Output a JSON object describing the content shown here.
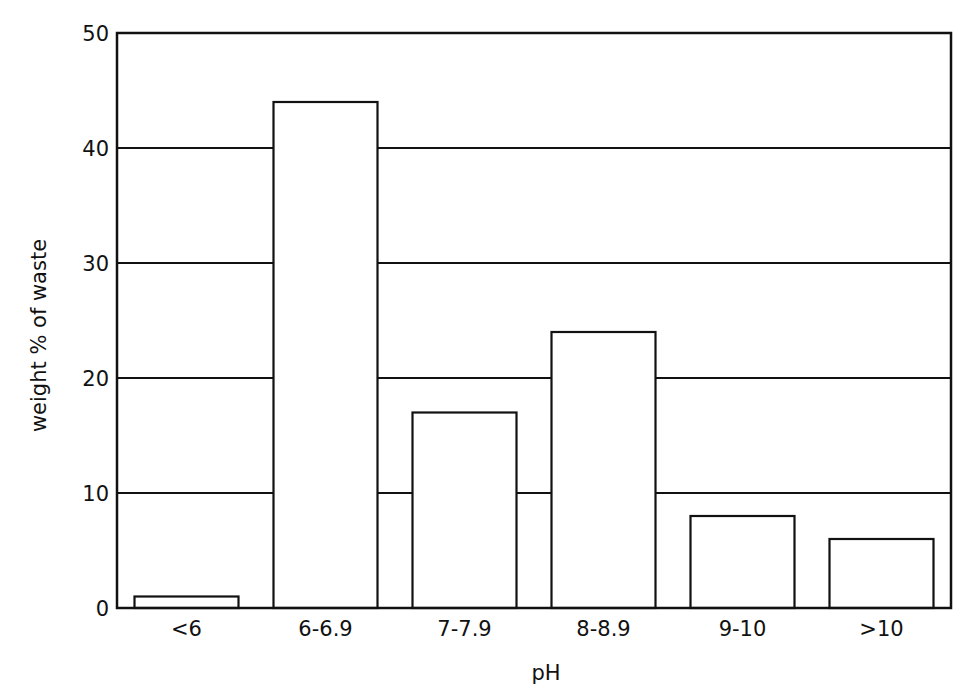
{
  "chart_data": {
    "type": "bar",
    "title": "",
    "xlabel": "pH",
    "ylabel": "weight % of waste",
    "categories": [
      "<6",
      "6-6.9",
      "7-7.9",
      "8-8.9",
      "9-10",
      ">10"
    ],
    "values": [
      1,
      44,
      17,
      24,
      8,
      6
    ],
    "ylim": [
      0,
      50
    ],
    "yticks": [
      0,
      10,
      20,
      30,
      40,
      50
    ],
    "grid": "horizontal",
    "legend": "none",
    "bar_fill": "#ffffff",
    "line_color": "#111111"
  }
}
